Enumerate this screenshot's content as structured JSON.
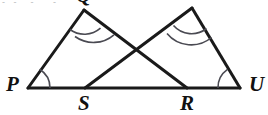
{
  "figure": {
    "stroke_color": "#1a1a1a",
    "arc_color": "#4a4a52",
    "background_color": "#ffffff",
    "stroke_width": 3,
    "arc_stroke_width": 1.6,
    "vertices": {
      "P": {
        "label": "P",
        "x": 28,
        "y": 88
      },
      "S": {
        "label": "S",
        "x": 85,
        "y": 88
      },
      "R": {
        "label": "R",
        "x": 187,
        "y": 88
      },
      "U": {
        "label": "U",
        "x": 240,
        "y": 88
      },
      "Q": {
        "label": "Q",
        "x": 84,
        "y": 10
      },
      "T": {
        "label": "T",
        "x": 192,
        "y": 8
      }
    },
    "segments": [
      {
        "name": "baseline-P-U",
        "x1": 28,
        "y1": 88,
        "x2": 240,
        "y2": 88
      },
      {
        "name": "side-P-Q",
        "x1": 28,
        "y1": 88,
        "x2": 84,
        "y2": 10
      },
      {
        "name": "side-Q-R",
        "x1": 84,
        "y1": 10,
        "x2": 187,
        "y2": 88
      },
      {
        "name": "side-S-T",
        "x1": 85,
        "y1": 88,
        "x2": 192,
        "y2": 8
      },
      {
        "name": "side-T-U",
        "x1": 192,
        "y1": 8,
        "x2": 240,
        "y2": 88
      }
    ],
    "intersection": {
      "name": "diagonal-crossing-point",
      "x": 133,
      "y": 52
    },
    "angle_marks": [
      {
        "name": "angle-arc-at-P",
        "vertex": "P",
        "arcs": 1
      },
      {
        "name": "angle-arc-at-U",
        "vertex": "U",
        "arcs": 1
      },
      {
        "name": "angle-arc-at-Q",
        "vertex": "Q",
        "arcs": 2
      },
      {
        "name": "angle-arc-at-T",
        "vertex": "T",
        "arcs": 2
      }
    ],
    "scan_artifact": "- -  -   -"
  }
}
